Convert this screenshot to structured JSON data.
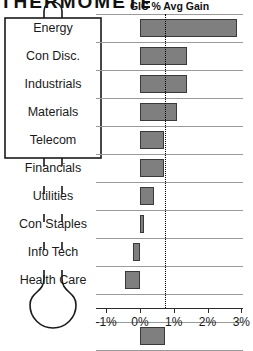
{
  "masthead": {
    "title": "THERMOMETER"
  },
  "chart_title": "GIC % Avg Gain",
  "axis": {
    "ticks": [
      "-1%",
      "0%",
      "1%",
      "2%",
      "3%"
    ],
    "tick_values": [
      -1,
      0,
      1,
      2,
      3
    ],
    "xlim": [
      -1.3,
      3.05
    ],
    "reference_line_value": 0.75
  },
  "icon": {
    "name": "thermometer-icon"
  },
  "chart_data": {
    "type": "bar",
    "orientation": "horizontal",
    "title": "GIC % Avg Gain",
    "xlabel": "",
    "ylabel": "",
    "xlim": [
      -1.3,
      3.05
    ],
    "grid": true,
    "legend": "none",
    "reference_line": 0.75,
    "categories": [
      "Energy",
      "Con Disc.",
      "Industrials",
      "Materials",
      "Telecom",
      "Financials",
      "Utilities",
      "Con Staples",
      "Info Tech",
      "Health Care",
      "",
      "Average"
    ],
    "values": [
      2.88,
      1.4,
      1.4,
      1.1,
      0.72,
      0.72,
      0.42,
      0.12,
      -0.2,
      -0.45,
      null,
      0.75
    ],
    "bar_color": "#7f7f7f",
    "bar_edge_color": "#3a3a3a"
  },
  "sectors": [
    {
      "label": "Energy"
    },
    {
      "label": "Con Disc."
    },
    {
      "label": "Industrials"
    },
    {
      "label": "Materials"
    },
    {
      "label": "Telecom"
    },
    {
      "label": "Financials"
    },
    {
      "label": "Utilities"
    },
    {
      "label": "Con Staples"
    },
    {
      "label": "Info Tech"
    },
    {
      "label": "Health Care"
    }
  ]
}
